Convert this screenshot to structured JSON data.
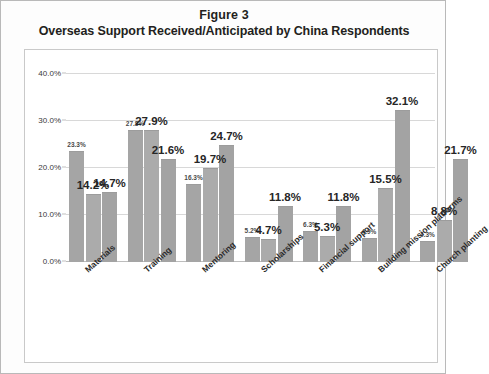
{
  "figure": {
    "title_line1": "Figure 3",
    "title_line2": "Overseas Support Received/Anticipated by China Respondents"
  },
  "chart_data": {
    "type": "bar",
    "title": "Overseas Support Received/Anticipated by China Respondents",
    "xlabel": "",
    "ylabel": "",
    "ylim": [
      0,
      40
    ],
    "ytick_labels": [
      "0.0%",
      "10.0%",
      "20.0%",
      "30.0%",
      "40.0%"
    ],
    "ytick_values": [
      0,
      10,
      20,
      30,
      40
    ],
    "grid": true,
    "legend": "none",
    "bar_color": "#a8a8a8",
    "categories": [
      "Materials",
      "Training",
      "Mentoring",
      "Scholarships",
      "Financial support",
      "Building mission platforms",
      "Church planting"
    ],
    "series": [
      {
        "name": "Series 1",
        "values": [
          23.3,
          27.8,
          16.3,
          5.2,
          6.3,
          4.9,
          4.3
        ]
      },
      {
        "name": "Series 2",
        "values": [
          14.2,
          27.9,
          19.7,
          4.7,
          5.3,
          15.5,
          8.8
        ]
      },
      {
        "name": "Series 3",
        "values": [
          14.7,
          21.6,
          24.7,
          11.8,
          11.8,
          32.1,
          21.7
        ]
      }
    ],
    "data_labels": [
      {
        "text": "23.3%",
        "size": "small"
      },
      {
        "text": "14.2%",
        "size": "large"
      },
      {
        "text": "14.7%",
        "size": "large"
      },
      {
        "text": "27.8%",
        "size": "small"
      },
      {
        "text": "27.9%",
        "size": "large"
      },
      {
        "text": "21.6%",
        "size": "large"
      },
      {
        "text": "16.3%",
        "size": "small"
      },
      {
        "text": "19.7%",
        "size": "large"
      },
      {
        "text": "24.7%",
        "size": "large"
      },
      {
        "text": "5.2%",
        "size": "small"
      },
      {
        "text": "4.7%",
        "size": "large"
      },
      {
        "text": "11.8%",
        "size": "large"
      },
      {
        "text": "6.3%",
        "size": "small"
      },
      {
        "text": "5.3%",
        "size": "large"
      },
      {
        "text": "11.8%",
        "size": "large"
      },
      {
        "text": "4.9%",
        "size": "small"
      },
      {
        "text": "15.5%",
        "size": "large"
      },
      {
        "text": "32.1%",
        "size": "large"
      },
      {
        "text": "4.3%",
        "size": "small"
      },
      {
        "text": "8.8%",
        "size": "large"
      },
      {
        "text": "21.7%",
        "size": "large"
      }
    ]
  }
}
